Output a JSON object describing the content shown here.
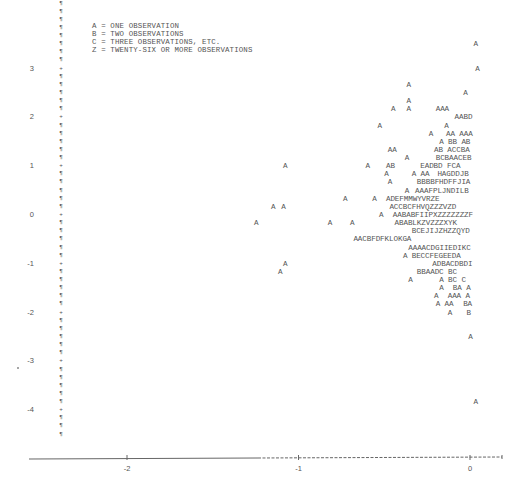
{
  "chart_data": {
    "type": "scatter",
    "title": "",
    "xlabel": "",
    "ylabel": "",
    "plot_style": "line-printer character plot",
    "legend": [
      "A = ONE OBSERVATION",
      "B = TWO OBSERVATIONS",
      "C = THREE OBSERVATIONS, ETC.",
      "Z = TWENTY-SIX OR MORE OBSERVATIONS"
    ],
    "x_ticks": [
      "-2",
      "-1",
      "0"
    ],
    "x_tick_values": [
      -2,
      -1,
      0
    ],
    "y_ticks": [
      "3",
      "2",
      "1",
      "0",
      "-1",
      "-2",
      "-3",
      "-4"
    ],
    "y_tick_values": [
      3,
      2,
      1,
      0,
      -1,
      -2,
      -3,
      -4
    ],
    "xlim": [
      -2.5,
      0.2
    ],
    "ylim": [
      -4.6,
      3.6
    ],
    "rows_per_unit_y": 6,
    "axis_fill_char": "¶",
    "axis_tick_char": "+",
    "rows": [
      {
        "y": 3.5,
        "marks": [
          {
            "x": 0.02,
            "text": "A"
          }
        ]
      },
      {
        "y": 3.0,
        "marks": [
          {
            "x": 0.03,
            "text": "A"
          }
        ]
      },
      {
        "y": 2.67,
        "marks": [
          {
            "x": -0.37,
            "text": "A"
          }
        ]
      },
      {
        "y": 2.5,
        "marks": [
          {
            "x": -0.04,
            "text": "A"
          }
        ]
      },
      {
        "y": 2.33,
        "marks": [
          {
            "x": -0.37,
            "text": "A"
          }
        ]
      },
      {
        "y": 2.17,
        "marks": [
          {
            "x": -0.46,
            "text": "A"
          },
          {
            "x": -0.37,
            "text": "A"
          },
          {
            "x": -0.2,
            "text": "AAA"
          }
        ]
      },
      {
        "y": 2.0,
        "marks": [
          {
            "x": -0.09,
            "text": "AABD"
          }
        ]
      },
      {
        "y": 1.83,
        "marks": [
          {
            "x": -0.54,
            "text": "A"
          },
          {
            "x": -0.15,
            "text": "A"
          }
        ]
      },
      {
        "y": 1.67,
        "marks": [
          {
            "x": -0.24,
            "text": "A"
          },
          {
            "x": -0.14,
            "text": "AA AAA"
          }
        ]
      },
      {
        "y": 1.5,
        "marks": [
          {
            "x": -0.18,
            "text": "A BB AB"
          }
        ]
      },
      {
        "y": 1.33,
        "marks": [
          {
            "x": -0.48,
            "text": "AA"
          },
          {
            "x": -0.21,
            "text": "AB ACCBA"
          }
        ]
      },
      {
        "y": 1.17,
        "marks": [
          {
            "x": -0.38,
            "text": "A"
          },
          {
            "x": -0.2,
            "text": "BCBAACEB"
          }
        ]
      },
      {
        "y": 1.0,
        "marks": [
          {
            "x": -1.09,
            "text": "A"
          },
          {
            "x": -0.61,
            "text": "A"
          },
          {
            "x": -0.49,
            "text": "AB"
          },
          {
            "x": -0.29,
            "text": "EADBD FCA"
          }
        ]
      },
      {
        "y": 0.83,
        "marks": [
          {
            "x": -0.5,
            "text": "A"
          },
          {
            "x": -0.34,
            "text": "A AA"
          },
          {
            "x": -0.19,
            "text": "HAGDDJB"
          }
        ]
      },
      {
        "y": 0.67,
        "marks": [
          {
            "x": -0.48,
            "text": "A"
          },
          {
            "x": -0.31,
            "text": "BBBBFHDFFJIA"
          }
        ]
      },
      {
        "y": 0.5,
        "marks": [
          {
            "x": -0.38,
            "text": "A"
          },
          {
            "x": -0.32,
            "text": "AAAFPLJNDILB"
          }
        ]
      },
      {
        "y": 0.33,
        "marks": [
          {
            "x": -0.74,
            "text": "A"
          },
          {
            "x": -0.57,
            "text": "A"
          },
          {
            "x": -0.49,
            "text": "ADEFMMWYVRZE"
          }
        ]
      },
      {
        "y": 0.17,
        "marks": [
          {
            "x": -1.16,
            "text": "A"
          },
          {
            "x": -1.1,
            "text": "A"
          },
          {
            "x": -0.47,
            "text": "ACCBCFHVQZZZVZD"
          }
        ]
      },
      {
        "y": 0.0,
        "marks": [
          {
            "x": -0.53,
            "text": "A"
          },
          {
            "x": -0.45,
            "text": "AABABFIIPXZZZZZZZF"
          }
        ]
      },
      {
        "y": -0.17,
        "marks": [
          {
            "x": -1.26,
            "text": "A"
          },
          {
            "x": -0.83,
            "text": "A"
          },
          {
            "x": -0.7,
            "text": "A"
          },
          {
            "x": -0.44,
            "text": "ABABLKZVZZZXYK"
          }
        ]
      },
      {
        "y": -0.33,
        "marks": [
          {
            "x": -0.34,
            "text": "BCEJIJZHZZQYD"
          }
        ]
      },
      {
        "y": -0.5,
        "marks": [
          {
            "x": -0.68,
            "text": "AACBFDFKLOKGA"
          }
        ]
      },
      {
        "y": -0.67,
        "marks": [
          {
            "x": -0.36,
            "text": "AAAACDGIIEDIKC"
          }
        ]
      },
      {
        "y": -0.83,
        "marks": [
          {
            "x": -0.39,
            "text": "A"
          },
          {
            "x": -0.34,
            "text": "BECCFEGEEDA"
          }
        ]
      },
      {
        "y": -1.0,
        "marks": [
          {
            "x": -1.09,
            "text": "A"
          },
          {
            "x": -0.22,
            "text": "ADBACDBDI"
          }
        ]
      },
      {
        "y": -1.17,
        "marks": [
          {
            "x": -1.12,
            "text": "A"
          },
          {
            "x": -0.31,
            "text": "BBAADC BC"
          }
        ]
      },
      {
        "y": -1.33,
        "marks": [
          {
            "x": -0.36,
            "text": "A"
          },
          {
            "x": -0.18,
            "text": "A BC C"
          }
        ]
      },
      {
        "y": -1.5,
        "marks": [
          {
            "x": -0.18,
            "text": "A"
          },
          {
            "x": -0.1,
            "text": "BA A"
          }
        ]
      },
      {
        "y": -1.67,
        "marks": [
          {
            "x": -0.21,
            "text": "A"
          },
          {
            "x": -0.13,
            "text": "AAA A"
          }
        ]
      },
      {
        "y": -1.83,
        "marks": [
          {
            "x": -0.2,
            "text": "A AA"
          },
          {
            "x": -0.04,
            "text": "BA"
          }
        ]
      },
      {
        "y": -2.0,
        "marks": [
          {
            "x": -0.13,
            "text": "A"
          },
          {
            "x": -0.02,
            "text": "B"
          }
        ]
      },
      {
        "y": -2.5,
        "marks": [
          {
            "x": -0.01,
            "text": "A"
          }
        ]
      },
      {
        "y": -3.83,
        "marks": [
          {
            "x": 0.02,
            "text": "A"
          }
        ]
      }
    ]
  }
}
